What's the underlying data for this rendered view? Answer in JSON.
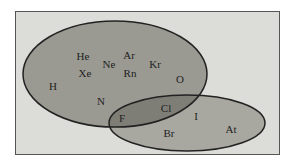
{
  "diagram": {
    "type": "venn",
    "colors": {
      "background": "#dcdcd8",
      "set_a_fill": "#9a9a92",
      "set_b_fill": "#a8a8a0",
      "overlap_fill": "#7e7e76",
      "stroke": "#222222"
    },
    "elements": [
      {
        "symbol": "He",
        "x": 83,
        "y": 60
      },
      {
        "symbol": "Xe",
        "x": 85,
        "y": 77
      },
      {
        "symbol": "Ne",
        "x": 109,
        "y": 68
      },
      {
        "symbol": "Ar",
        "x": 129,
        "y": 59
      },
      {
        "symbol": "Rn",
        "x": 130,
        "y": 77
      },
      {
        "symbol": "Kr",
        "x": 155,
        "y": 68
      },
      {
        "symbol": "O",
        "x": 180,
        "y": 83
      },
      {
        "symbol": "H",
        "x": 53,
        "y": 90
      },
      {
        "symbol": "N",
        "x": 101,
        "y": 105
      },
      {
        "symbol": "Cl",
        "x": 166,
        "y": 112
      },
      {
        "symbol": "F",
        "x": 122,
        "y": 122
      },
      {
        "symbol": "I",
        "x": 196,
        "y": 120
      },
      {
        "symbol": "Br",
        "x": 169,
        "y": 137
      },
      {
        "symbol": "At",
        "x": 231,
        "y": 133
      }
    ]
  }
}
